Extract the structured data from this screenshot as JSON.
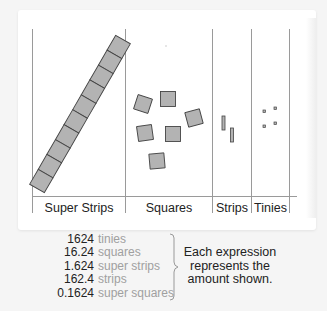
{
  "diagram": {
    "columns": [
      {
        "label": "Super Strips",
        "count": 1,
        "description": "one super strip of 10 squares"
      },
      {
        "label": "Squares",
        "count": 6
      },
      {
        "label": "Strips",
        "count": 2
      },
      {
        "label": "Tinies",
        "count": 4
      }
    ],
    "colors": {
      "piece_fill": "#b3b3b3",
      "piece_stroke": "#444444",
      "grid_line": "#999999"
    }
  },
  "expressions": [
    {
      "value": "1624",
      "unit": "tinies"
    },
    {
      "value": "16.24",
      "unit": "squares"
    },
    {
      "value": "1.624",
      "unit": "super strips"
    },
    {
      "value": "162.4",
      "unit": "strips"
    },
    {
      "value": "0.1624",
      "unit": "super squares"
    }
  ],
  "note": {
    "line1": "Each expression",
    "line2": "represents the",
    "line3": "amount shown."
  }
}
